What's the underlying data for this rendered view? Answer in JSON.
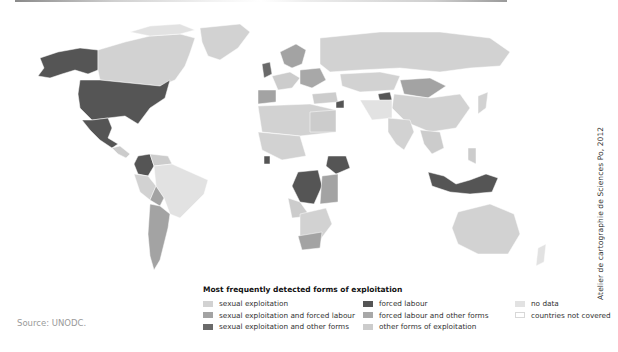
{
  "colors": {
    "sexual_exploitation": "#d2d2d2",
    "sexual_and_forced": "#a3a3a3",
    "sexual_and_other": "#6a6a6a",
    "forced_labour": "#555555",
    "forced_and_other": "#a8a8a8",
    "other_forms": "#cccccc",
    "no_data": "#e2e2e2",
    "not_covered": "#ffffff"
  },
  "legend": {
    "title": "Most frequently detected forms of exploitation",
    "items": [
      {
        "label": "sexual exploitation",
        "color": "#d2d2d2"
      },
      {
        "label": "sexual exploitation and forced labour",
        "color": "#a3a3a3"
      },
      {
        "label": "sexual exploitation and other forms",
        "color": "#6a6a6a"
      },
      {
        "label": "forced labour",
        "color": "#555555"
      },
      {
        "label": "forced labour and other forms",
        "color": "#a8a8a8"
      },
      {
        "label": "other forms of exploitation",
        "color": "#cccccc"
      },
      {
        "label": "no data",
        "color": "#e2e2e2"
      },
      {
        "label": "countries not covered",
        "color": "#ffffff"
      }
    ]
  },
  "credit": "Atelier de cartographie de Sciences Po, 2012",
  "source": "Source: UNODC."
}
